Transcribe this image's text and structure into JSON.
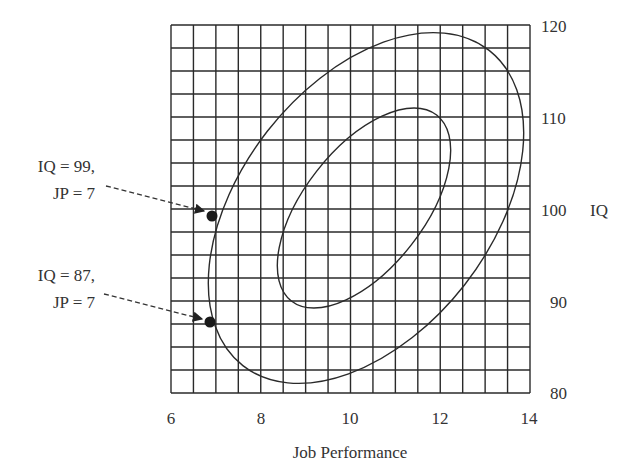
{
  "chart_data": {
    "type": "scatter",
    "title": "",
    "xlabel": "Job Performance",
    "ylabel": "IQ",
    "xlim": [
      6,
      14
    ],
    "ylim": [
      80,
      120
    ],
    "x_ticks": [
      6,
      8,
      10,
      12,
      14
    ],
    "y_ticks": [
      80,
      90,
      100,
      110,
      120
    ],
    "x_tick_labels": [
      "6",
      "8",
      "10",
      "12",
      "14"
    ],
    "y_tick_labels": [
      "80",
      "90",
      "100",
      "110",
      "120"
    ],
    "y_axis_position": "right",
    "grid": {
      "on": true,
      "x_step": 0.5,
      "y_step": 2.5
    },
    "legend": null,
    "contours": [
      {
        "name": "outer-ellipse",
        "center": [
          10.4,
          100.2
        ],
        "description": "larger concentration ellipse, positively tilted",
        "x_extent": [
          6.7,
          14.0
        ],
        "y_extent": [
          81.2,
          119.0
        ]
      },
      {
        "name": "inner-ellipse",
        "center": [
          10.3,
          100.2
        ],
        "description": "smaller concentration ellipse, positively tilted",
        "x_extent": [
          8.3,
          12.6
        ],
        "y_extent": [
          90.2,
          110.5
        ]
      }
    ],
    "points": [
      {
        "x": 7,
        "y": 99,
        "label_line1": "IQ = 99,",
        "label_line2": "JP = 7"
      },
      {
        "x": 7,
        "y": 87,
        "label_line1": "IQ = 87,",
        "label_line2": "JP = 7"
      }
    ]
  },
  "labels": {
    "x_axis_title": "Job Performance",
    "y_axis_title": "IQ",
    "annotation_1_line1": "IQ = 99,",
    "annotation_1_line2": "JP = 7",
    "annotation_2_line1": "IQ = 87,",
    "annotation_2_line2": "JP = 7",
    "x_ticks": [
      "6",
      "8",
      "10",
      "12",
      "14"
    ],
    "y_ticks": [
      "120",
      "110",
      "100",
      "90",
      "80"
    ]
  }
}
